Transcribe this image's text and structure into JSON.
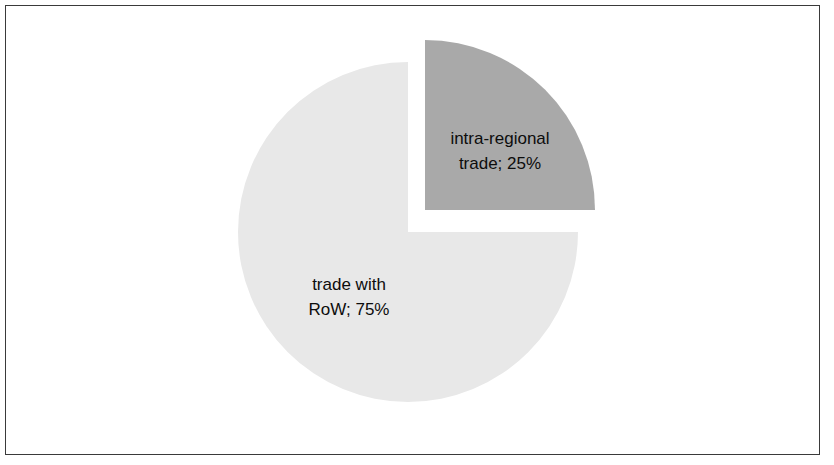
{
  "figure": {
    "background_color": "#ffffff",
    "frame_color": "#3a3a3a",
    "label_color": "#0d0d0d"
  },
  "chart_data": {
    "type": "pie",
    "title": "",
    "subtitle": "",
    "xlabel": "",
    "ylabel": "",
    "grid": false,
    "legend": "none",
    "labels_inside_slices": true,
    "label_format": "name; percent",
    "start_angle_deg": 0,
    "direction": "clockwise",
    "categories": [
      "intra-regional trade",
      "trade with RoW"
    ],
    "values": [
      25,
      75
    ],
    "units": "percent",
    "slices": [
      {
        "name": "intra-regional trade",
        "value": 25,
        "percent": "25%",
        "label": "intra-regional\ntrade; 25%",
        "color": "#a9a9a9",
        "exploded": true,
        "start_angle_deg": 0,
        "end_angle_deg": 90
      },
      {
        "name": "trade with RoW",
        "value": 75,
        "percent": "75%",
        "label": "trade with\nRoW; 75%",
        "color": "#e8e8e8",
        "exploded": false,
        "start_angle_deg": 90,
        "end_angle_deg": 360
      }
    ],
    "geometry": {
      "center_x": 408,
      "center_y": 232,
      "radius": 170,
      "explode_offset_x": 17,
      "explode_offset_y": -22
    }
  }
}
